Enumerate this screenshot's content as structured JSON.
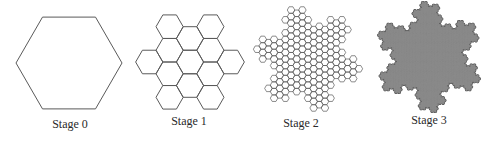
{
  "figure": {
    "stages": [
      {
        "label": "Stage 0",
        "level": 0,
        "cell_count": 1,
        "style": "outline"
      },
      {
        "label": "Stage 1",
        "level": 1,
        "cell_count": 13,
        "style": "outline"
      },
      {
        "label": "Stage 2",
        "level": 2,
        "cell_count": 169,
        "style": "outline"
      },
      {
        "label": "Stage 3",
        "level": 3,
        "cell_count": 2197,
        "style": "filled"
      }
    ],
    "colors": {
      "stroke": "#5a5a5a",
      "fill": "#8a8a8a",
      "filled_outline": "#4a4a4a",
      "label": "#2a2a2a",
      "background": "#ffffff"
    }
  }
}
